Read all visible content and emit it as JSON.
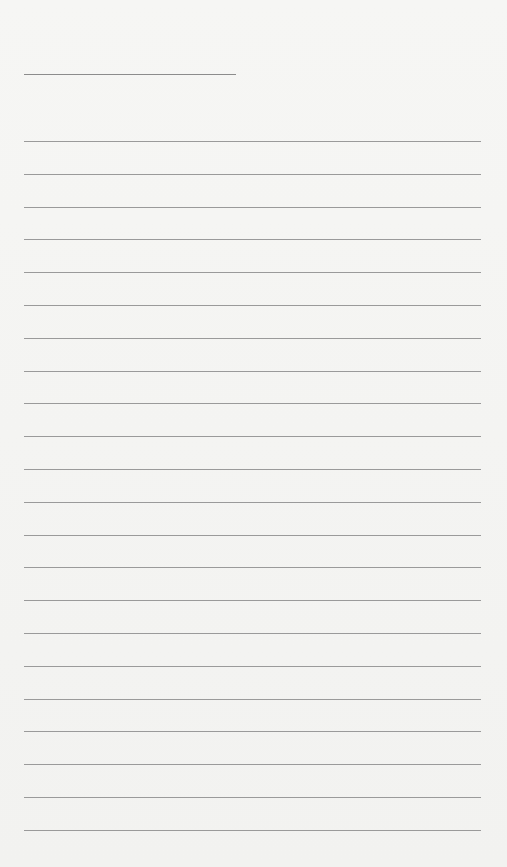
{
  "page": {
    "type": "lined-paper",
    "background": "#f4f4f2",
    "line_color": "#9a9a9a",
    "title_line": {
      "x": 24,
      "y": 74,
      "width": 212
    },
    "rules": {
      "x": 24,
      "width": 457,
      "start_y": 141,
      "spacing": 32.8,
      "count": 22
    }
  }
}
